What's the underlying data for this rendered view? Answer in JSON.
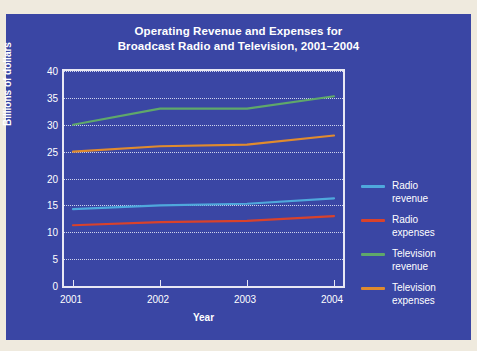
{
  "figure": {
    "background_color": "#3a46a4",
    "page_background_color": "#efeade",
    "title_line1": "Operating Revenue and Expenses for",
    "title_line2": "Broadcast Radio and Television, 2001–2004"
  },
  "chart_data": {
    "type": "line",
    "title": "Operating Revenue and Expenses for Broadcast Radio and Television, 2001–2004",
    "xlabel": "Year",
    "ylabel": "Billions of dollars",
    "x": [
      2001,
      2002,
      2003,
      2004
    ],
    "categories": [
      "2001",
      "2002",
      "2003",
      "2004"
    ],
    "xticklabels": [
      "2001",
      "2002",
      "2003",
      "2004"
    ],
    "yticklabels": [
      "0",
      "5",
      "10",
      "15",
      "20",
      "25",
      "30",
      "35",
      "40"
    ],
    "yticks": [
      0,
      5,
      10,
      15,
      20,
      25,
      30,
      35,
      40
    ],
    "ylim": [
      0,
      40
    ],
    "grid": "horizontal-dotted",
    "legend_position": "right",
    "series": [
      {
        "name": "Radio revenue",
        "label_line1": "Radio",
        "label_line2": "revenue",
        "color": "#4fa8dc",
        "values": [
          14.3,
          15.0,
          15.3,
          16.3
        ]
      },
      {
        "name": "Radio expenses",
        "label_line1": "Radio",
        "label_line2": "expenses",
        "color": "#d9422b",
        "values": [
          11.3,
          11.9,
          12.1,
          13.0
        ]
      },
      {
        "name": "Television revenue",
        "label_line1": "Television",
        "label_line2": "revenue",
        "color": "#5fa86a",
        "values": [
          30.0,
          33.0,
          33.0,
          35.3
        ]
      },
      {
        "name": "Television expenses",
        "label_line1": "Television",
        "label_line2": "expenses",
        "color": "#e08b2e",
        "values": [
          25.0,
          26.0,
          26.3,
          28.0
        ]
      }
    ]
  }
}
